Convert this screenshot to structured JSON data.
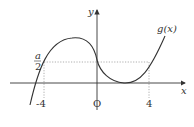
{
  "diagram": {
    "type": "function-graph",
    "curve_label": "g(x)",
    "axes": {
      "x_label": "x",
      "y_label": "y",
      "origin_label": "O"
    },
    "x_ticks": [
      "-4",
      "4"
    ],
    "y_marker": {
      "numerator": "a",
      "denominator": "2"
    },
    "colors": {
      "curve": "#333333",
      "axis": "#333333",
      "guide": "#999999"
    }
  }
}
